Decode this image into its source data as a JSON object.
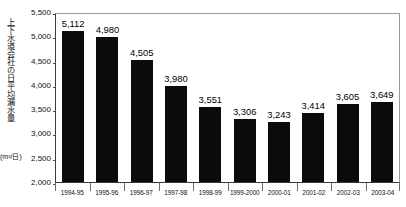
{
  "chart_data": {
    "type": "bar",
    "title": "",
    "subtitle": "",
    "xlabel": "",
    "ylabel": "上下水道会社の日平均漏水量",
    "ylabel_unit": "(m³/日)",
    "ylim": [
      2000,
      5500
    ],
    "ytick_step": 500,
    "yticks": [
      "5,500",
      "5,000",
      "4,500",
      "4,000",
      "3,500",
      "3,000",
      "2,500",
      "2,000"
    ],
    "ytick_values": [
      5500,
      5000,
      4500,
      4000,
      3500,
      3000,
      2500,
      2000
    ],
    "grid": false,
    "legend": null,
    "bar_color": "#0b0b0b",
    "categories": [
      "1994-95",
      "1995-96",
      "1996-97",
      "1997-98",
      "1998-99",
      "1999-2000",
      "2000-01",
      "2001-02",
      "2002-03",
      "2003-04"
    ],
    "values": [
      5112,
      4980,
      4505,
      3980,
      3551,
      3306,
      3243,
      3414,
      3605,
      3649
    ],
    "value_labels": [
      "5,112",
      "4,980",
      "4,505",
      "3,980",
      "3,551",
      "3,306",
      "3,243",
      "3,414",
      "3,605",
      "3,649"
    ]
  }
}
